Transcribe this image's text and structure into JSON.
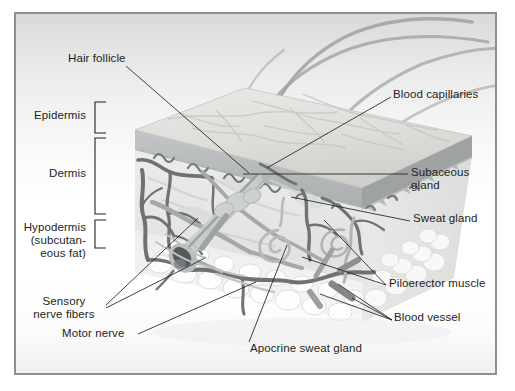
{
  "figure": {
    "type": "anatomical-diagram",
    "colors": {
      "frame_border": "#8e8e8e",
      "text": "#231f20",
      "leader_line": "#231f20",
      "epidermis": "#b9bcbd",
      "dermis": "#e3e5e4",
      "hypodermis": "#f1f1f0",
      "blood_vessel_dark": "#6f7375",
      "blood_vessel_mid": "#9a9d9f",
      "hair": "#9b9fa1",
      "follicle_bulb": "#54585a"
    }
  },
  "labels": {
    "hair_follicle": "Hair follicle",
    "epidermis": "Epidermis",
    "dermis": "Dermis",
    "hypodermis_line1": "Hypodermis",
    "hypodermis_line2": "(subcutan-",
    "hypodermis_line3": "eous fat)",
    "sensory_line1": "Sensory",
    "sensory_line2": "nerve fibers",
    "motor_nerve": "Motor nerve",
    "apocrine_sweat_gland": "Apocrine sweat gland",
    "blood_capillaries": "Blood capillaries",
    "subaceous_line1": "Subaceous",
    "subaceous_line2": "gland",
    "sweat_gland": "Sweat gland",
    "piloerector_muscle": "Piloerector muscle",
    "blood_vessel": "Blood vessel"
  },
  "layer_brackets": [
    {
      "name": "Epidermis",
      "top": 100,
      "bottom": 131
    },
    {
      "name": "Dermis",
      "top": 136,
      "bottom": 212
    },
    {
      "name": "Hypodermis (subcutaneous fat)",
      "top": 218,
      "bottom": 246
    }
  ]
}
